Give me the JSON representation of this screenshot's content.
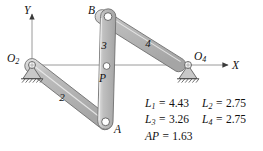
{
  "figure": {
    "background_color": "#ffffff",
    "link_fill": "#b3b3b3",
    "link_highlight": "#dcdcdc",
    "link_stroke": "#6a6a6a",
    "axis_color": "#8a8a8a",
    "text_color": "#111111"
  },
  "axes": {
    "x_label": "X",
    "y_label": "Y"
  },
  "joints": [
    {
      "id": "O2",
      "label": "O",
      "sub": "2",
      "x": 32,
      "y": 65
    },
    {
      "id": "O4",
      "label": "O",
      "sub": "4",
      "x": 188,
      "y": 65
    },
    {
      "id": "A",
      "label": "A",
      "sub": "",
      "x": 105,
      "y": 122
    },
    {
      "id": "B",
      "label": "B",
      "sub": "",
      "x": 108,
      "y": 16
    },
    {
      "id": "P",
      "label": "P",
      "sub": "",
      "x": 106,
      "y": 68
    }
  ],
  "links": [
    {
      "id": "link2",
      "label": "2"
    },
    {
      "id": "link3",
      "label": "3"
    },
    {
      "id": "link4",
      "label": "4"
    }
  ],
  "dimensions": {
    "rows": [
      [
        {
          "name": "L",
          "sub": "1",
          "value": "4.43"
        },
        {
          "name": "L",
          "sub": "2",
          "value": "2.75"
        }
      ],
      [
        {
          "name": "L",
          "sub": "3",
          "value": "3.26"
        },
        {
          "name": "L",
          "sub": "4",
          "value": "2.75"
        }
      ],
      [
        {
          "name": "AP",
          "sub": "",
          "value": "1.63"
        }
      ]
    ]
  }
}
